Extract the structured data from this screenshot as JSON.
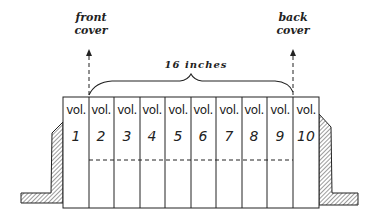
{
  "diagram": {
    "title": "",
    "labels": {
      "front_cover": [
        "front",
        "cover"
      ],
      "back_cover": [
        "back",
        "cover"
      ],
      "measurement": "16 inches"
    },
    "volumes": [
      {
        "word": "vol.",
        "number": "1"
      },
      {
        "word": "vol.",
        "number": "2"
      },
      {
        "word": "vol.",
        "number": "3"
      },
      {
        "word": "vol.",
        "number": "4"
      },
      {
        "word": "vol.",
        "number": "5"
      },
      {
        "word": "vol.",
        "number": "6"
      },
      {
        "word": "vol.",
        "number": "7"
      },
      {
        "word": "vol.",
        "number": "8"
      },
      {
        "word": "vol.",
        "number": "9"
      },
      {
        "word": "vol.",
        "number": "10"
      }
    ],
    "colors": {
      "line": "#222222",
      "background": "#ffffff"
    }
  }
}
